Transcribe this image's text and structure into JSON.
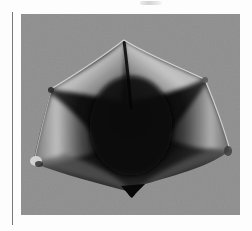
{
  "page": {
    "type": "scanned-book-plate",
    "figure": {
      "subject": "specimen photograph",
      "description": "Pentagonal winged seed pod / specimen with dark center and translucent lighter lobes, photographed on a gray background",
      "background_color": "#8e8e8e",
      "specimen_dark_color": "#0a0a0a",
      "specimen_highlight_color": "#d4d4d4"
    },
    "caption": ""
  }
}
